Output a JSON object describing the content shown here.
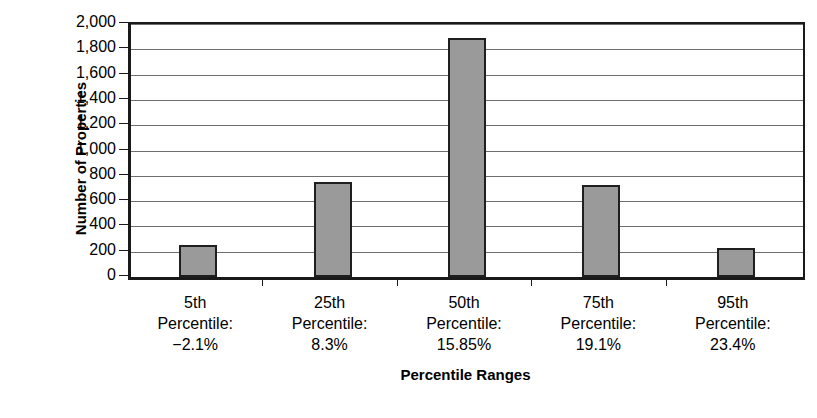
{
  "chart_data": {
    "type": "bar",
    "title": "",
    "xlabel": "Percentile Ranges",
    "ylabel": "Number of Properties",
    "categories": [
      "5th Percentile: −2.1%",
      "25th Percentile: 8.3%",
      "50th Percentile: 15.85%",
      "75th Percentile: 19.1%",
      "95th Percentile: 23.4%"
    ],
    "category_lines": [
      [
        "5th",
        "Percentile:",
        "−2.1%"
      ],
      [
        "25th",
        "Percentile:",
        "8.3%"
      ],
      [
        "50th",
        "Percentile:",
        "15.85%"
      ],
      [
        "75th",
        "Percentile:",
        "19.1%"
      ],
      [
        "95th",
        "Percentile:",
        "23.4%"
      ]
    ],
    "values": [
      255,
      755,
      1890,
      730,
      230
    ],
    "ylim": [
      0,
      2000
    ],
    "ytick_values": [
      0,
      200,
      400,
      600,
      800,
      1000,
      1200,
      1400,
      1600,
      1800,
      2000
    ],
    "ytick_labels": [
      "0",
      "200",
      "400",
      "600",
      "800",
      "1,000",
      "1,200",
      "1,400",
      "1,600",
      "1,800",
      "2,000"
    ],
    "grid": true,
    "legend": "none",
    "bar_color": "#9a9a9a",
    "bar_edge_color": "#1f1f1f",
    "axis_color": "#1a1a1a",
    "gridline_color": "#6e6e6e",
    "background_color": "#ffffff"
  }
}
